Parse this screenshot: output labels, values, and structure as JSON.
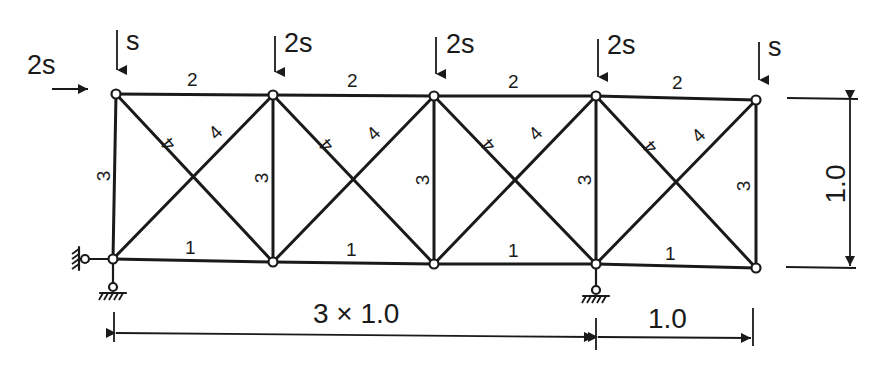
{
  "diagram": {
    "type": "truss",
    "colors": {
      "line": "#1a1a1a",
      "background": "#ffffff"
    },
    "loads": {
      "horizontal": {
        "label": "2s",
        "node": "T1",
        "direction": "right"
      },
      "vertical": [
        {
          "label": "s",
          "node": "T1"
        },
        {
          "label": "2s",
          "node": "T2"
        },
        {
          "label": "2s",
          "node": "T3"
        },
        {
          "label": "2s",
          "node": "T4"
        },
        {
          "label": "s",
          "node": "T5"
        }
      ]
    },
    "member_labels": {
      "top_chord": [
        "2",
        "2",
        "2",
        "2"
      ],
      "bottom_chord": [
        "1",
        "1",
        "1",
        "1"
      ],
      "verticals": [
        "3",
        "3",
        "3",
        "3",
        "3"
      ],
      "diagonals_descending": [
        "4",
        "4",
        "4",
        "4"
      ],
      "diagonals_ascending": [
        "4",
        "4",
        "4",
        "4"
      ]
    },
    "supports": [
      {
        "node": "B1",
        "type": "pin-horizontal-and-vertical"
      },
      {
        "node": "B4",
        "type": "pin-vertical"
      }
    ],
    "dimensions": {
      "bottom_left": "3 × 1.0",
      "bottom_right": "1.0",
      "height": "1.0"
    }
  }
}
